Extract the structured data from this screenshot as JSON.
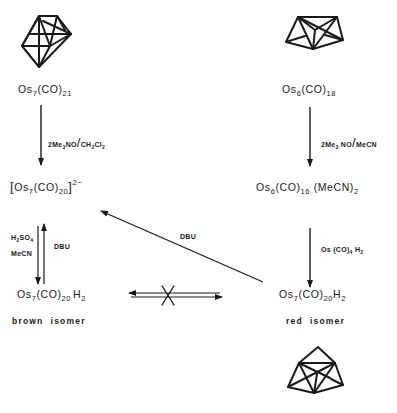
{
  "diagram": {
    "colors": {
      "ink": "#1a1a1a",
      "background": "#ffffff"
    },
    "clusters": [
      {
        "id": "os7-capped-octahedron",
        "depicts": "Os7 cluster polyhedron (top left)"
      },
      {
        "id": "os6-bicapped-tetrahedron",
        "depicts": "Os6 cluster polyhedron (top right)"
      },
      {
        "id": "os7-red-isomer-cluster",
        "depicts": "Os7 cluster polyhedron of red isomer (bottom right)"
      }
    ],
    "compounds": {
      "os7co21": {
        "el": "Os",
        "n": "7",
        "mid": "(CO)",
        "m": "21"
      },
      "os6co18": {
        "el": "Os",
        "n": "6",
        "mid": "(CO)",
        "m": "18"
      },
      "os7co20_dianion": {
        "open": "[",
        "el": "Os",
        "n": "7",
        "mid": "(CO)",
        "m": "20",
        "close": "]",
        "charge": "2−"
      },
      "os6co16mecn2": {
        "el": "Os",
        "n": "6",
        "mid": "(CO)",
        "m": "16",
        "tail": " (MeCN)",
        "k": "2"
      },
      "brown_hydride": {
        "el": "Os",
        "n": "7",
        "mid": "(CO)",
        "m": "20",
        "tail": "H",
        "k": "2"
      },
      "red_hydride": {
        "el": "Os",
        "n": "7",
        "mid": "(CO)",
        "m": "20",
        "tail": "H",
        "k": "2"
      }
    },
    "isomer_labels": {
      "brown": "brown  isomer",
      "red": "red  isomer"
    },
    "reagents": {
      "left_top": {
        "a": "2Me",
        "a_sub": "3",
        "b": "NO",
        "slash": "/",
        "c": "CH",
        "c_sub": "2",
        "d": "Cl",
        "d_sub": "2"
      },
      "right_top": {
        "a": "2Me",
        "a_sub": "3",
        "b": " NO",
        "slash": "/",
        "c": "MeCN"
      },
      "left_acid": {
        "a": "H",
        "a_sub": "2",
        "b": "SO",
        "b_sub": "4"
      },
      "left_solvent": "MeCN",
      "left_base": "DBU",
      "diagonal_base": "DBU",
      "right_bottom": {
        "a": "Os (CO)",
        "a_sub": "4",
        "b": " H",
        "b_sub": "2"
      }
    },
    "arrows": [
      {
        "from": "Os7(CO)21",
        "to": "[Os7(CO)20]2-",
        "label": "2Me3NO/CH2Cl2"
      },
      {
        "from": "Os6(CO)18",
        "to": "Os6(CO)16(MeCN)2",
        "label": "2Me3NO/MeCN"
      },
      {
        "from": "[Os7(CO)20]2-",
        "to": "Os7(CO)20H2 brown",
        "label": "H2SO4 MeCN"
      },
      {
        "from": "Os7(CO)20H2 brown",
        "to": "[Os7(CO)20]2-",
        "label": "DBU"
      },
      {
        "from": "Os6(CO)16(MeCN)2",
        "to": "Os7(CO)20H2 red",
        "label": "Os(CO)4H2"
      },
      {
        "from": "Os7(CO)20H2 red",
        "to": "[Os7(CO)20]2-",
        "label": "DBU"
      },
      {
        "from": "brown isomer",
        "to": "red isomer",
        "label": "no interconversion (crossed equilibrium)"
      }
    ]
  }
}
